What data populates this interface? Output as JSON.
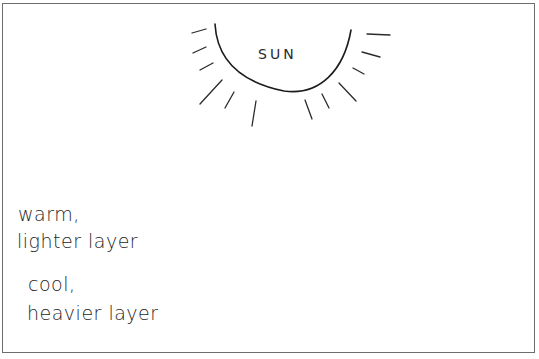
{
  "diagram": {
    "title": "",
    "sun": {
      "label": "SUN"
    },
    "labels": {
      "warm_line1": "warm,",
      "warm_line2": "lighter layer",
      "cool_line1": "cool,",
      "cool_line2": "heavier layer"
    },
    "elements": [
      "sun (half circle with rays)",
      "two arrows of sunlight pointing down into lake",
      "lake basin cross-section",
      "upper warm layer with three large circulation loops",
      "lower cool dense layer with three small circulation loops",
      "pointer arrows from labels to layers",
      "tree on right shore"
    ],
    "colors": {
      "ink": "#1c1c1c",
      "border": "#6e6e6e",
      "background": "#ffffff"
    }
  }
}
